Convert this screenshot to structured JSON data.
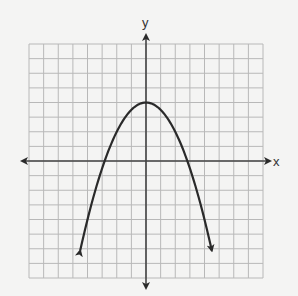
{
  "chart_data": {
    "type": "line",
    "title": "",
    "xlabel": "x",
    "ylabel": "y",
    "xlim": [
      -8,
      8
    ],
    "ylim": [
      -8,
      8
    ],
    "grid": true,
    "grid_step": 1,
    "tick_labels": false,
    "series": [
      {
        "name": "parabola",
        "equation": "y = 4 - 0.5x^2",
        "vertex": [
          0,
          4
        ],
        "x_intercepts": [
          -2.83,
          2.83
        ],
        "endpoints_arrows": [
          [
            -4.5,
            -6.1
          ],
          [
            4.5,
            -6.1
          ]
        ],
        "x": [
          -4.5,
          -4,
          -3,
          -2,
          -1,
          0,
          1,
          2,
          3,
          4,
          4.5
        ],
        "values": [
          -6.1,
          -4,
          -0.5,
          2,
          3.5,
          4,
          3.5,
          2,
          -0.5,
          -4,
          -6.1
        ]
      }
    ]
  },
  "colors": {
    "background": "#f4f4f3",
    "grid": "#b8b8b8",
    "axes": "#444444",
    "curve": "#2a2a2a"
  },
  "labels": {
    "x_axis": "x",
    "y_axis": "y"
  }
}
